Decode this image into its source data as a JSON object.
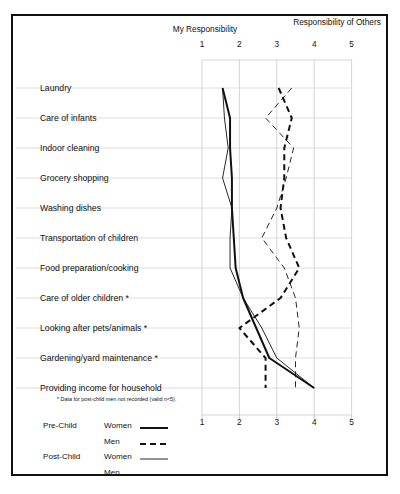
{
  "header": {
    "left_title": "My Responsibility",
    "right_title": "Responsibility of Others"
  },
  "footnote": "*  Data for post-child men not recorded (valid n<5).",
  "legend": {
    "groups": [
      {
        "name": "Pre-Child",
        "rows": [
          {
            "label": "Women",
            "style": "thick-solid"
          },
          {
            "label": "Men",
            "style": "thick-dashed"
          }
        ]
      },
      {
        "name": "Post-Child",
        "rows": [
          {
            "label": "Women",
            "style": "thin-solid"
          },
          {
            "label": "Men",
            "style": "thin-dashed"
          }
        ]
      }
    ]
  },
  "chart_data": {
    "type": "line",
    "title": "",
    "xlabel": "",
    "ylabel": "",
    "xlim": [
      1,
      5
    ],
    "xticks": [
      1,
      2,
      3,
      4,
      5
    ],
    "ticklabels": [
      "1",
      "2",
      "3",
      "4",
      "5"
    ],
    "grid": true,
    "orientation": "horizontal-categories",
    "axis_anchor_labels": {
      "low": "My Responsibility",
      "high": "Responsibility of Others"
    },
    "categories": [
      "Laundry",
      "Care of infants",
      "Indoor cleaning",
      "Grocery shopping",
      "Washing dishes",
      "Transportation of children",
      "Food preparation/cooking",
      "Care of older children *",
      "Looking after pets/animals *",
      "Gardening/yard maintenance *",
      "Providing income for household"
    ],
    "series": [
      {
        "name": "Pre-Child Women",
        "style": "thick-solid",
        "values": [
          1.55,
          1.75,
          1.75,
          1.8,
          1.8,
          1.85,
          1.9,
          2.1,
          2.45,
          2.8,
          4.0
        ]
      },
      {
        "name": "Pre-Child Men",
        "style": "thick-dashed",
        "values": [
          3.05,
          3.4,
          3.2,
          3.2,
          3.1,
          3.25,
          3.6,
          3.1,
          2.0,
          2.7,
          2.7
        ]
      },
      {
        "name": "Post-Child Women",
        "style": "thin-solid",
        "values": [
          1.55,
          1.6,
          1.7,
          1.55,
          1.8,
          1.75,
          1.75,
          2.1,
          2.6,
          3.0,
          4.0
        ]
      },
      {
        "name": "Post-Child Men",
        "style": "thin-dashed",
        "values": [
          3.4,
          2.7,
          3.45,
          3.25,
          3.0,
          2.6,
          3.2,
          3.5,
          3.6,
          3.5,
          3.5
        ]
      }
    ]
  }
}
